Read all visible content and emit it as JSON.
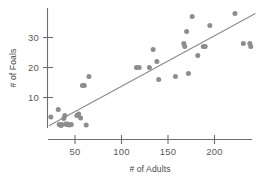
{
  "chart_data": {
    "type": "scatter",
    "title": "",
    "xlabel": "# of Adults",
    "ylabel": "# of Foals",
    "xlim": [
      20,
      250
    ],
    "ylim": [
      0,
      38
    ],
    "xticks": [
      50,
      100,
      150,
      200
    ],
    "xtick_labels": [
      "50",
      "100",
      "150",
      "200"
    ],
    "yticks": [
      10,
      20,
      30
    ],
    "ytick_labels": [
      "10",
      "20",
      "30"
    ],
    "grid": false,
    "legend": null,
    "marker_color": "#8d8d8d",
    "line_color": "#8a8a8a",
    "axis_color": "#6d6d6d",
    "series": [
      {
        "name": "foals vs adults",
        "points": [
          [
            24,
            3.5
          ],
          [
            32,
            6.0
          ],
          [
            33,
            1.0
          ],
          [
            35,
            0.7
          ],
          [
            36,
            1.0
          ],
          [
            38,
            3.0
          ],
          [
            39,
            4.0
          ],
          [
            40,
            1.2
          ],
          [
            41,
            1.0
          ],
          [
            42,
            1.2
          ],
          [
            44,
            0.8
          ],
          [
            46,
            1.0
          ],
          [
            52,
            4.0
          ],
          [
            54,
            4.5
          ],
          [
            56,
            3.2
          ],
          [
            58,
            14.0
          ],
          [
            60,
            14.0
          ],
          [
            62,
            0.8
          ],
          [
            65,
            17.0
          ],
          [
            116,
            20.0
          ],
          [
            119,
            20.0
          ],
          [
            130,
            20.0
          ],
          [
            134,
            26.0
          ],
          [
            138,
            22.0
          ],
          [
            140,
            16.0
          ],
          [
            158,
            17.0
          ],
          [
            167,
            28.0
          ],
          [
            168,
            27.0
          ],
          [
            170,
            32.0
          ],
          [
            172,
            18.0
          ],
          [
            176,
            37.0
          ],
          [
            182,
            24.0
          ],
          [
            188,
            27.0
          ],
          [
            190,
            27.0
          ],
          [
            195,
            34.0
          ],
          [
            222,
            38.0
          ],
          [
            231,
            28.0
          ],
          [
            238,
            28.0
          ],
          [
            239,
            27.0
          ]
        ]
      }
    ],
    "trendline": {
      "name": "least-squares fit",
      "x_start": 22,
      "y_start": 0.6,
      "x_end": 244,
      "y_end": 38.0
    }
  },
  "axes": {
    "y_axis_title": "# of Foals",
    "x_axis_title": "# of Adults"
  }
}
